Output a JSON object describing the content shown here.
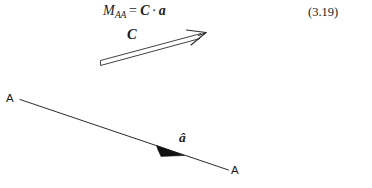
{
  "figure": {
    "kind": "textbook-vector-diagram",
    "background_color": "#ffffff",
    "ink_color": "#1a1a1a",
    "width": 372,
    "height": 188
  },
  "equation": {
    "symbol": "M",
    "subscript": "AA",
    "equals": "=",
    "matrix": "C",
    "dot": "·",
    "vector": "a",
    "number": "(3.19)"
  },
  "labels": {
    "c_vector": "C",
    "a_hat_vector": "â",
    "axis_left": "A",
    "axis_right": "A"
  },
  "geometry": {
    "c_arrow": {
      "style": "double-line-outline-arrow",
      "tail_x": 100,
      "tail_y": 64,
      "tip_x": 206,
      "tip_y": 33
    },
    "axis_line": {
      "style": "thin-solid-line",
      "start_x": 20,
      "start_y": 100,
      "end_x": 228,
      "end_y": 170
    },
    "a_hat_arrow": {
      "style": "solid-filled-wedge",
      "tail_x": 157,
      "tail_y": 145,
      "tip_x": 184,
      "tip_y": 155
    }
  }
}
